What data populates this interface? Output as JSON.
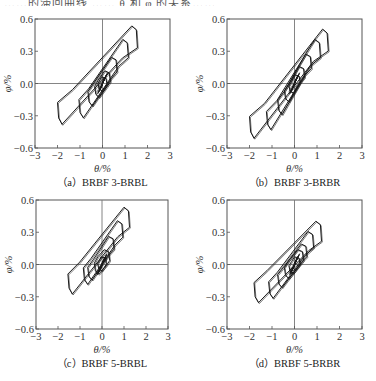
{
  "header_fragment": "……的滞回曲线 …… θ 和 φ 的关系……",
  "chart_data": [
    {
      "type": "line",
      "panel": "a",
      "caption": "（a）BRBF 3-BRBL",
      "xlabel": "θ/%",
      "ylabel": "φ/%",
      "xlim": [
        -3,
        3
      ],
      "ylim": [
        -0.6,
        0.6
      ],
      "xticks": [
        "−3",
        "−2",
        "−1",
        "0",
        "1",
        "2",
        "3"
      ],
      "yticks": [
        "0.6",
        "0.3",
        "0.0",
        "−0.3",
        "−0.6"
      ],
      "grid": false,
      "zero_lines": true,
      "loops": [
        {
          "amp_x": 0.15,
          "pos": [
            0.15,
            0.05
          ],
          "neg": [
            -0.15,
            -0.05
          ],
          "width": 0.04
        },
        {
          "amp_x": 0.3,
          "pos": [
            0.3,
            0.1
          ],
          "neg": [
            -0.3,
            -0.1
          ],
          "width": 0.06
        },
        {
          "amp_x": 0.6,
          "pos": [
            0.6,
            0.22
          ],
          "neg": [
            -0.6,
            -0.17
          ],
          "width": 0.08
        },
        {
          "amp_x": 1.0,
          "pos": [
            1.1,
            0.38
          ],
          "neg": [
            -1.0,
            -0.27
          ],
          "width": 0.1
        },
        {
          "amp_x": 1.5,
          "pos": [
            1.5,
            0.5
          ],
          "neg": [
            -1.95,
            -0.32
          ],
          "width": 0.12
        }
      ],
      "peak_points": {
        "max": [
          1.2,
          0.51
        ],
        "min": [
          -1.45,
          -0.43
        ]
      }
    },
    {
      "type": "line",
      "panel": "b",
      "caption": "（b）BRBF 3-BRBR",
      "xlabel": "θ/%",
      "ylabel": "φ/%",
      "xlim": [
        -3,
        3
      ],
      "ylim": [
        -0.6,
        0.6
      ],
      "xticks": [
        "−3",
        "−2",
        "−1",
        "0",
        "1",
        "2",
        "3"
      ],
      "yticks": [
        "0.6",
        "0.3",
        "0.0",
        "−0.3",
        "−0.6"
      ],
      "grid": false,
      "zero_lines": true,
      "loops": [
        {
          "amp_x": 0.2,
          "pos": [
            0.2,
            0.07
          ],
          "neg": [
            -0.2,
            -0.07
          ],
          "width": 0.04
        },
        {
          "amp_x": 0.4,
          "pos": [
            0.4,
            0.14
          ],
          "neg": [
            -0.4,
            -0.14
          ],
          "width": 0.06
        },
        {
          "amp_x": 0.7,
          "pos": [
            0.7,
            0.25
          ],
          "neg": [
            -0.7,
            -0.25
          ],
          "width": 0.08
        },
        {
          "amp_x": 1.1,
          "pos": [
            1.1,
            0.38
          ],
          "neg": [
            -1.2,
            -0.38
          ],
          "width": 0.1
        },
        {
          "amp_x": 1.5,
          "pos": [
            1.45,
            0.47
          ],
          "neg": [
            -1.95,
            -0.45
          ],
          "width": 0.12
        }
      ],
      "peak_points": {
        "max": [
          1.2,
          0.48
        ],
        "min": [
          -1.6,
          -0.52
        ]
      }
    },
    {
      "type": "line",
      "panel": "c",
      "caption": "（c）BRBF 5-BRBL",
      "xlabel": "θ/%",
      "ylabel": "φ/%",
      "xlim": [
        -3,
        3
      ],
      "ylim": [
        -0.6,
        0.6
      ],
      "xticks": [
        "−3",
        "−2",
        "−1",
        "0",
        "1",
        "2",
        "3"
      ],
      "yticks": [
        "0.6",
        "0.3",
        "0.0",
        "−0.3",
        "−0.6"
      ],
      "grid": false,
      "zero_lines": true,
      "loops": [
        {
          "amp_x": 0.15,
          "pos": [
            0.15,
            0.06
          ],
          "neg": [
            -0.15,
            -0.04
          ],
          "width": 0.04
        },
        {
          "amp_x": 0.3,
          "pos": [
            0.3,
            0.12
          ],
          "neg": [
            -0.3,
            -0.06
          ],
          "width": 0.06
        },
        {
          "amp_x": 0.5,
          "pos": [
            0.5,
            0.24
          ],
          "neg": [
            -0.6,
            -0.11
          ],
          "width": 0.07
        },
        {
          "amp_x": 0.9,
          "pos": [
            0.9,
            0.38
          ],
          "neg": [
            -0.8,
            -0.14
          ],
          "width": 0.09
        },
        {
          "amp_x": 1.3,
          "pos": [
            1.2,
            0.5
          ],
          "neg": [
            -1.5,
            -0.22
          ],
          "width": 0.11
        }
      ],
      "peak_points": {
        "max": [
          1.05,
          0.52
        ],
        "min": [
          -1.35,
          -0.3
        ]
      }
    },
    {
      "type": "line",
      "panel": "d",
      "caption": "（d）BRBF 5-BRBR",
      "xlabel": "θ/%",
      "ylabel": "φ/%",
      "xlim": [
        -3,
        3
      ],
      "ylim": [
        -0.6,
        0.6
      ],
      "xticks": [
        "−3",
        "−2",
        "−1",
        "0",
        "1",
        "2",
        "3"
      ],
      "yticks": [
        "0.6",
        "0.3",
        "0.0",
        "−0.3",
        "−0.6"
      ],
      "grid": false,
      "zero_lines": true,
      "loops": [
        {
          "amp_x": 0.2,
          "pos": [
            0.2,
            0.06
          ],
          "neg": [
            -0.2,
            -0.06
          ],
          "width": 0.04
        },
        {
          "amp_x": 0.35,
          "pos": [
            0.35,
            0.12
          ],
          "neg": [
            -0.4,
            -0.1
          ],
          "width": 0.06
        },
        {
          "amp_x": 0.5,
          "pos": [
            0.5,
            0.17
          ],
          "neg": [
            -0.7,
            -0.18
          ],
          "width": 0.07
        },
        {
          "amp_x": 0.8,
          "pos": [
            0.8,
            0.28
          ],
          "neg": [
            -1.1,
            -0.27
          ],
          "width": 0.09
        },
        {
          "amp_x": 1.2,
          "pos": [
            1.15,
            0.37
          ],
          "neg": [
            -1.75,
            -0.3
          ],
          "width": 0.11
        }
      ],
      "peak_points": {
        "max": [
          1.05,
          0.38
        ],
        "min": [
          -1.4,
          -0.44
        ]
      }
    }
  ],
  "layout": {
    "panels": [
      {
        "left": 35,
        "top": 19,
        "right": 170,
        "bottom": 148
      },
      {
        "left": 227,
        "top": 19,
        "right": 362,
        "bottom": 148
      },
      {
        "left": 36,
        "top": 200,
        "right": 168,
        "bottom": 329
      },
      {
        "left": 227,
        "top": 200,
        "right": 362,
        "bottom": 329
      }
    ],
    "line_color": "#1a1a1a",
    "axis_color": "#555555"
  }
}
